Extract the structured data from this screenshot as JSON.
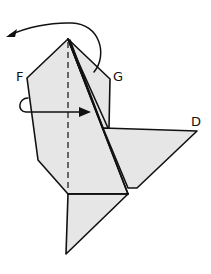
{
  "diagram": {
    "type": "origami-fold-step",
    "labels": {
      "F": "F",
      "G": "G",
      "D": "D"
    },
    "colors": {
      "paper": "#e6e6e6",
      "line": "#111111",
      "background": "#ffffff"
    },
    "annotations": {
      "top_arrow": "curved arrow from the right flap looping over the apex toward the upper left",
      "left_arrow": "loop arrow at left edge pointing right across the valley fold",
      "center_fold": "dashed vertical valley-fold line from apex down the center"
    }
  }
}
